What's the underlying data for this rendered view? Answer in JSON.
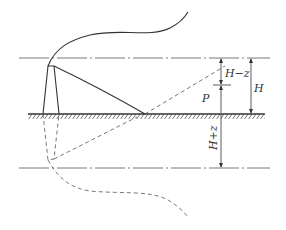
{
  "diagram": {
    "title": "",
    "colors": {
      "line": "#333333",
      "background": "#ffffff"
    },
    "labels": {
      "h_minus_z": "H−z",
      "p": "P",
      "h": "H",
      "h_plus_z": "H+z"
    },
    "elements": [
      "top-reference-line",
      "ground-line",
      "ground-hatching",
      "bottom-image-reference-line",
      "chimney",
      "plume",
      "direct-ray-to-ground",
      "reflected-ray-dashed",
      "image-chimney-dashed",
      "image-plume-dashed",
      "image-ray-dashed",
      "dimension-arrows"
    ]
  }
}
